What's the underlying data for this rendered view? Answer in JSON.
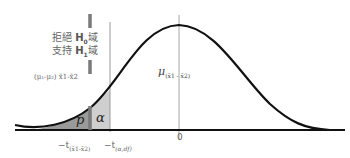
{
  "diagram": {
    "type": "t-distribution one-tailed test",
    "labels": {
      "reject_h0_prefix": "拒絕 ",
      "reject_h0_symbol": "H",
      "reject_h0_sub": "0",
      "reject_h0_suffix": "域",
      "support_h1_prefix": "支持 ",
      "support_h1_symbol": "H",
      "support_h1_sub": "1",
      "support_h1_suffix": "域",
      "observed_diff": "(μ₁-μ₂) x̄1-x̄2",
      "p_region": "p",
      "alpha_region": "α",
      "mean_symbol": "μ",
      "mean_sub": "(x̄1 - x̄2)",
      "t_observed_prefix": "−t",
      "t_observed_sub": "(x̄1-x̄2)",
      "t_critical_prefix": "−t",
      "t_critical_sub": "(α,df)",
      "zero_tick": "0"
    },
    "colors": {
      "curve": "#111111",
      "baseline": "#111111",
      "p_fill": "#9a9a9a",
      "alpha_fill": "#cfcfcf",
      "dashed_line": "#777777",
      "reference_lines": "#a0a0a0"
    }
  }
}
